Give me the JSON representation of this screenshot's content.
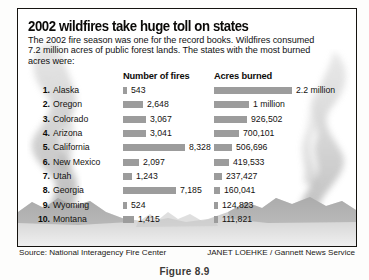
{
  "panel": {
    "title": "2002 wildfires take huge toll on states",
    "subtitle": "The 2002 fire season was one for the record books. Wildfires consumed 7.2 million acres of public forest lands. The states with the most burned acres were:"
  },
  "columns": {
    "fires_header": "Number of fires",
    "acres_header": "Acres burned"
  },
  "footer": {
    "source": "Source: National Interagency Fire Center",
    "credit": "JANET LOEHKE / Gannett News Service",
    "figure_caption": "Figure 8.9"
  },
  "colors": {
    "bar": "#9c9c9c",
    "border": "#15130f",
    "text": "#14120f",
    "background": "#ffffff"
  },
  "chart_data": {
    "type": "bar",
    "title": "2002 wildfires take huge toll on states",
    "xlabel": "",
    "ylabel": "",
    "orientation": "horizontal",
    "grid": false,
    "legend": "none",
    "categories": [
      "Alaska",
      "Oregon",
      "Colorado",
      "Arizona",
      "California",
      "New Mexico",
      "Utah",
      "Georgia",
      "Wyoming",
      "Montana"
    ],
    "ranks": [
      "1.",
      "2.",
      "3.",
      "4.",
      "5.",
      "6.",
      "7.",
      "8.",
      "9.",
      "10."
    ],
    "series": [
      {
        "name": "Number of fires",
        "values": [
          543,
          2648,
          3067,
          3041,
          8328,
          2097,
          1243,
          7185,
          524,
          1415
        ],
        "labels": [
          "543",
          "2,648",
          "3,067",
          "3,041",
          "8,328",
          "2,097",
          "1,243",
          "7,185",
          "524",
          "1,415"
        ],
        "max": 8328
      },
      {
        "name": "Acres burned",
        "values": [
          2200000,
          1000000,
          926502,
          700101,
          506696,
          419533,
          237427,
          160041,
          124823,
          111821
        ],
        "labels": [
          "2.2 million",
          "1 million",
          "926,502",
          "700,101",
          "506,696",
          "419,533",
          "237,427",
          "160,041",
          "124,823",
          "111,821"
        ],
        "max": 2200000
      }
    ]
  }
}
